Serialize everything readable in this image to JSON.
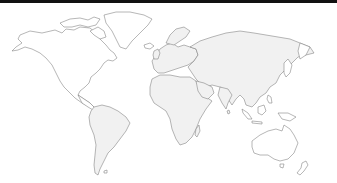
{
  "map": {
    "type": "world-outline",
    "projection": "equirectangular-like",
    "colors": {
      "background": "#ffffff",
      "top_bar": "#111111",
      "land_fill": "#f1f1f1",
      "land_fill_plain": "#ffffff",
      "outline": "#7a7a7a",
      "shade": "#e9e9e9"
    },
    "regions": [
      {
        "name": "north-america"
      },
      {
        "name": "greenland"
      },
      {
        "name": "south-america"
      },
      {
        "name": "europe"
      },
      {
        "name": "africa"
      },
      {
        "name": "asia"
      },
      {
        "name": "australia"
      },
      {
        "name": "new-zealand"
      },
      {
        "name": "madagascar"
      },
      {
        "name": "japan"
      },
      {
        "name": "indonesia"
      }
    ]
  }
}
